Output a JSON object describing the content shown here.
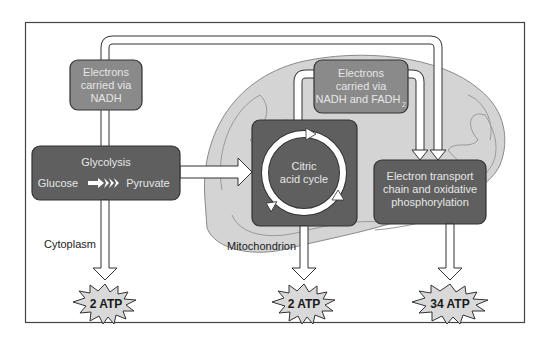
{
  "diagram": {
    "regions": {
      "cytoplasm_label": "Cytoplasm",
      "mitochondrion_label": "Mitochondrion"
    },
    "carriers": {
      "nadh": [
        "Electrons",
        "carried via",
        "NADH"
      ],
      "nadh_fadh2": [
        "Electrons",
        "carried via",
        "NADH and FADH"
      ],
      "fadh2_subscript": "2"
    },
    "stages": {
      "glycolysis": {
        "title": "Glycolysis",
        "input": "Glucose",
        "output": "Pyruvate"
      },
      "citric_acid_cycle": [
        "Citric",
        "acid cycle"
      ],
      "electron_transport": [
        "Electron transport",
        "chain and oxidative",
        "phosphorylation"
      ]
    },
    "yields": {
      "glycolysis_atp": "2 ATP",
      "citric_acid_atp": "2 ATP",
      "etc_atp": "34 ATP"
    },
    "colors": {
      "dark_box": "#5f5f5f",
      "medium_box": "#8a8a8a",
      "mitochondrion_fill": "#d4d4d4",
      "starburst_fill": "#d9d9d9",
      "arrow_fill": "#ffffff",
      "outline": "#333333"
    }
  }
}
